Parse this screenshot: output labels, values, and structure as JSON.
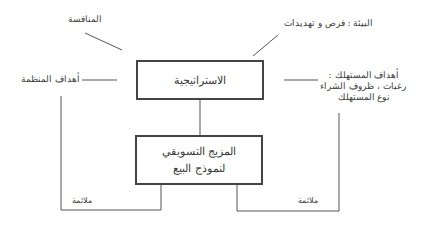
{
  "diagram": {
    "type": "flow",
    "nodes": {
      "strategy": {
        "label": "الاستراتيجية"
      },
      "marketing_mix": {
        "line1": "المزيج التسويقي",
        "line2": "لنموذج البيع"
      }
    },
    "inputs": {
      "competition": "المنافسة",
      "environment": "البيئة : فرص و تهديدات",
      "org_goals": "أهداف المنظمة",
      "consumer_goals": {
        "line1": "أهداف المستهلك :",
        "line2": "رغبات ، ظروف الشراء",
        "line3": "نوع المستهلك"
      }
    },
    "fit_labels": {
      "left": "ملائمة",
      "right": "ملائمة"
    },
    "colors": {
      "line": "#555555",
      "box_border": "#444444",
      "text": "#3a3a3a"
    }
  }
}
